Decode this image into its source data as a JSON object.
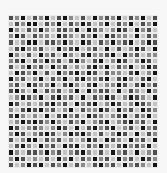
{
  "mosaic": {
    "rows": 25,
    "cols": 25,
    "palette": [
      "#141414",
      "#4f4f4f",
      "#8a8a8a",
      "#c4c4c4"
    ],
    "gap_color": "#ececec",
    "background": "#f7f7f7",
    "cells": [
      "1203120310231302120312031",
      "3120031203120132031203120",
      "0231202311203012320130213",
      "2013122301231203012230312",
      "1320031120230131202103201",
      "3102213302103213031320130",
      "0231302130231022103021322",
      "2103120213102310320132013",
      "1320213021323102031203201",
      "3012031302102013122310320",
      "0213203120310221031023103",
      "2130122031023103220131021",
      "1023031213203021130312302",
      "3201203102130312013201230",
      "0132321021302103201320123",
      "2310102132031220130213012",
      "1023230310213012321031203",
      "3201012023120321032102130",
      "0132123201303102103213021",
      "2013210132010231320130312",
      "1320031213232013012302130",
      "3102302130103120231021203",
      "0231120213210231302130321",
      "2013231302031202130213012",
      "1320103120312310213021230"
    ]
  }
}
